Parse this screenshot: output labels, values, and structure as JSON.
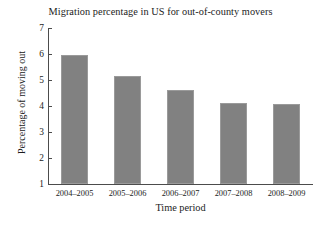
{
  "chart_data": {
    "type": "bar",
    "title": "Migration percentage in US for out-of-county movers",
    "xlabel": "Time period",
    "ylabel": "Percentage of moving out",
    "categories": [
      "2004–2005",
      "2005–2006",
      "2006–2007",
      "2007–2008",
      "2008–2009"
    ],
    "values": [
      5.95,
      5.15,
      4.6,
      4.12,
      4.07
    ],
    "ylim": [
      1,
      7
    ],
    "yticks": [
      1,
      2,
      3,
      4,
      5,
      6,
      7
    ],
    "ytick_labels": [
      "1",
      "2",
      "3",
      "4",
      "5",
      "6",
      "7"
    ],
    "grid": false,
    "legend": null,
    "bar_color": "#818181",
    "axis_color": "#4c4c4c",
    "background_color": "#ffffff"
  }
}
